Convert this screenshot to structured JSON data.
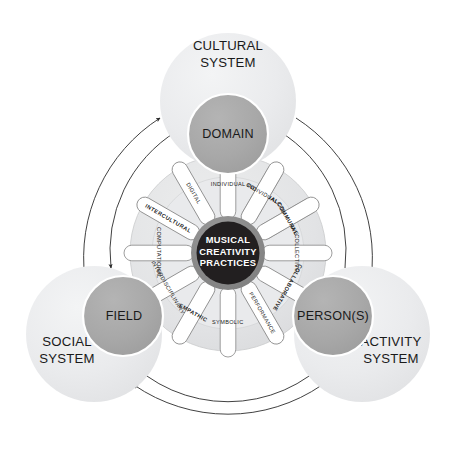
{
  "diagram": {
    "title": "Musical Creativity Practices",
    "hub": {
      "line1": "MUSICAL",
      "line2": "CREATIVITY",
      "line3": "PRACTICES",
      "fill": "#221f20",
      "text_color": "#ffffff",
      "ring_fill": "#8a8a8a"
    },
    "systems": [
      {
        "id": "cultural",
        "system_line1": "CULTURAL",
        "system_line2": "SYSTEM",
        "node_label": "DOMAIN",
        "outer_fill": "#ebecee",
        "inner_fill": "#a9a9a9"
      },
      {
        "id": "social",
        "system_line1": "SOCIAL",
        "system_line2": "SYSTEM",
        "node_label": "FIELD",
        "outer_fill": "#ebecee",
        "inner_fill": "#a9a9a9"
      },
      {
        "id": "activity",
        "system_line1": "ACTIVITY",
        "system_line2": "SYSTEM",
        "node_label": "PERSON(S)",
        "outer_fill": "#ebecee",
        "inner_fill": "#a9a9a9"
      }
    ],
    "spokes": [
      {
        "label": "COMMUNAL",
        "emphasis": true
      },
      {
        "label": "COLLECTIVE",
        "emphasis": false
      },
      {
        "label": "COLLABORATIVE",
        "emphasis": true
      },
      {
        "label": "PERFORMANCE",
        "emphasis": false
      },
      {
        "label": "SYMBOLIC",
        "emphasis": false
      },
      {
        "label": "EMPATHIC",
        "emphasis": true
      },
      {
        "label": "INTERDISCIPLINARY",
        "emphasis": false
      },
      {
        "label": "COMPUTATIONAL",
        "emphasis": false
      },
      {
        "label": "INTERCULTURAL",
        "emphasis": true
      },
      {
        "label": "DIGITAL",
        "emphasis": false
      },
      {
        "label": "INDIVIDUAL",
        "emphasis": false
      },
      {
        "label": "COLLECTIVE_DUP",
        "emphasis": false
      }
    ],
    "colors": {
      "arc_stroke": "#2b2b2b",
      "spoke_outline": "#8d8d8d",
      "spoke_fill": "#ffffff",
      "wheel_ring_fill": "#e3e4e6",
      "background": "#ffffff"
    }
  }
}
